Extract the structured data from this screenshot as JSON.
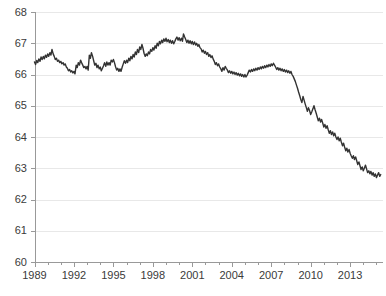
{
  "chart_data": {
    "type": "line",
    "title": "",
    "subtitle": "",
    "xlabel": "",
    "ylabel": "",
    "xlim": [
      1989,
      2015.5
    ],
    "ylim": [
      60,
      68
    ],
    "grid": true,
    "legend": null,
    "line_color": "#333333",
    "axis_color": "#999999",
    "grid_color": "#e8e8e8",
    "y_ticks": [
      60,
      61,
      62,
      63,
      64,
      65,
      66,
      67,
      68
    ],
    "y_tick_labels": [
      "60",
      "61",
      "62",
      "63",
      "64",
      "65",
      "66",
      "67",
      "68"
    ],
    "x_ticks": [
      1989,
      1992,
      1995,
      1998,
      2001,
      2004,
      2007,
      2010,
      2013
    ],
    "x_tick_labels": [
      "1989",
      "1992",
      "1995",
      "1998",
      "2001",
      "2004",
      "2007",
      "2010",
      "2013"
    ],
    "x_minor_tick_step": 1,
    "series": [
      {
        "name": "rate",
        "x": [
          1989.0,
          1989.08,
          1989.17,
          1989.25,
          1989.33,
          1989.42,
          1989.5,
          1989.58,
          1989.67,
          1989.75,
          1989.83,
          1989.92,
          1990.0,
          1990.08,
          1990.17,
          1990.25,
          1990.33,
          1990.42,
          1990.5,
          1990.58,
          1990.67,
          1990.75,
          1990.83,
          1990.92,
          1991.0,
          1991.08,
          1991.17,
          1991.25,
          1991.33,
          1991.42,
          1991.5,
          1991.58,
          1991.67,
          1991.75,
          1991.83,
          1991.92,
          1992.0,
          1992.08,
          1992.17,
          1992.25,
          1992.33,
          1992.42,
          1992.5,
          1992.58,
          1992.67,
          1992.75,
          1992.83,
          1992.92,
          1993.0,
          1993.08,
          1993.17,
          1993.25,
          1993.33,
          1993.42,
          1993.5,
          1993.58,
          1993.67,
          1993.75,
          1993.83,
          1993.92,
          1994.0,
          1994.08,
          1994.17,
          1994.25,
          1994.33,
          1994.42,
          1994.5,
          1994.58,
          1994.67,
          1994.75,
          1994.83,
          1994.92,
          1995.0,
          1995.08,
          1995.17,
          1995.25,
          1995.33,
          1995.42,
          1995.5,
          1995.58,
          1995.67,
          1995.75,
          1995.83,
          1995.92,
          1996.0,
          1996.08,
          1996.17,
          1996.25,
          1996.33,
          1996.42,
          1996.5,
          1996.58,
          1996.67,
          1996.75,
          1996.83,
          1996.92,
          1997.0,
          1997.08,
          1997.17,
          1997.25,
          1997.33,
          1997.42,
          1997.5,
          1997.58,
          1997.67,
          1997.75,
          1997.83,
          1997.92,
          1998.0,
          1998.08,
          1998.17,
          1998.25,
          1998.33,
          1998.42,
          1998.5,
          1998.58,
          1998.67,
          1998.75,
          1998.83,
          1998.92,
          1999.0,
          1999.08,
          1999.17,
          1999.25,
          1999.33,
          1999.42,
          1999.5,
          1999.58,
          1999.67,
          1999.75,
          1999.83,
          1999.92,
          2000.0,
          2000.08,
          2000.17,
          2000.25,
          2000.33,
          2000.42,
          2000.5,
          2000.58,
          2000.67,
          2000.75,
          2000.83,
          2000.92,
          2001.0,
          2001.08,
          2001.17,
          2001.25,
          2001.33,
          2001.42,
          2001.5,
          2001.58,
          2001.67,
          2001.75,
          2001.83,
          2001.92,
          2002.0,
          2002.08,
          2002.17,
          2002.25,
          2002.33,
          2002.42,
          2002.5,
          2002.58,
          2002.67,
          2002.75,
          2002.83,
          2002.92,
          2003.0,
          2003.08,
          2003.17,
          2003.25,
          2003.33,
          2003.42,
          2003.5,
          2003.58,
          2003.67,
          2003.75,
          2003.83,
          2003.92,
          2004.0,
          2004.08,
          2004.17,
          2004.25,
          2004.33,
          2004.42,
          2004.5,
          2004.58,
          2004.67,
          2004.75,
          2004.83,
          2004.92,
          2005.0,
          2005.08,
          2005.17,
          2005.25,
          2005.33,
          2005.42,
          2005.5,
          2005.58,
          2005.67,
          2005.75,
          2005.83,
          2005.92,
          2006.0,
          2006.08,
          2006.17,
          2006.25,
          2006.33,
          2006.42,
          2006.5,
          2006.58,
          2006.67,
          2006.75,
          2006.83,
          2006.92,
          2007.0,
          2007.08,
          2007.17,
          2007.25,
          2007.33,
          2007.42,
          2007.5,
          2007.58,
          2007.67,
          2007.75,
          2007.83,
          2007.92,
          2008.0,
          2008.08,
          2008.17,
          2008.25,
          2008.33,
          2008.42,
          2008.5,
          2008.58,
          2008.67,
          2008.75,
          2008.83,
          2008.92,
          2009.0,
          2009.08,
          2009.17,
          2009.25,
          2009.33,
          2009.42,
          2009.5,
          2009.58,
          2009.67,
          2009.75,
          2009.83,
          2009.92,
          2010.0,
          2010.08,
          2010.17,
          2010.25,
          2010.33,
          2010.42,
          2010.5,
          2010.58,
          2010.67,
          2010.75,
          2010.83,
          2010.92,
          2011.0,
          2011.08,
          2011.17,
          2011.25,
          2011.33,
          2011.42,
          2011.5,
          2011.58,
          2011.67,
          2011.75,
          2011.83,
          2011.92,
          2012.0,
          2012.08,
          2012.17,
          2012.25,
          2012.33,
          2012.42,
          2012.5,
          2012.58,
          2012.67,
          2012.75,
          2012.83,
          2012.92,
          2013.0,
          2013.08,
          2013.17,
          2013.25,
          2013.33,
          2013.42,
          2013.5,
          2013.58,
          2013.67,
          2013.75,
          2013.83,
          2013.92,
          2014.0,
          2014.08,
          2014.17,
          2014.25,
          2014.33,
          2014.42,
          2014.5,
          2014.58,
          2014.67,
          2014.75,
          2014.83,
          2014.92,
          2015.0,
          2015.08,
          2015.17,
          2015.25,
          2015.33
        ],
        "values": [
          66.4,
          66.32,
          66.45,
          66.38,
          66.5,
          66.42,
          66.56,
          66.48,
          66.58,
          66.5,
          66.62,
          66.55,
          66.66,
          66.58,
          66.7,
          66.62,
          66.8,
          66.66,
          66.58,
          66.48,
          66.52,
          66.42,
          66.46,
          66.38,
          66.42,
          66.34,
          66.38,
          66.3,
          66.34,
          66.24,
          66.2,
          66.12,
          66.16,
          66.08,
          66.12,
          66.05,
          66.1,
          66.02,
          66.3,
          66.22,
          66.38,
          66.3,
          66.46,
          66.38,
          66.3,
          66.22,
          66.26,
          66.18,
          66.26,
          66.14,
          66.62,
          66.52,
          66.7,
          66.58,
          66.44,
          66.3,
          66.36,
          66.22,
          66.3,
          66.18,
          66.24,
          66.12,
          66.2,
          66.28,
          66.38,
          66.26,
          66.4,
          66.3,
          66.38,
          66.3,
          66.46,
          66.4,
          66.48,
          66.38,
          66.24,
          66.14,
          66.2,
          66.1,
          66.18,
          66.1,
          66.24,
          66.34,
          66.44,
          66.36,
          66.46,
          66.38,
          66.52,
          66.44,
          66.58,
          66.5,
          66.64,
          66.56,
          66.72,
          66.64,
          66.8,
          66.7,
          66.88,
          66.8,
          66.96,
          66.84,
          66.68,
          66.58,
          66.66,
          66.6,
          66.72,
          66.66,
          66.8,
          66.74,
          66.86,
          66.78,
          66.92,
          66.84,
          67.0,
          66.92,
          67.06,
          66.98,
          67.1,
          67.02,
          67.14,
          67.06,
          67.16,
          67.05,
          67.12,
          67.02,
          67.1,
          67.0,
          67.08,
          66.98,
          67.06,
          67.14,
          67.2,
          67.1,
          67.18,
          67.08,
          67.16,
          67.06,
          67.3,
          67.2,
          67.12,
          67.02,
          67.1,
          67.0,
          67.08,
          66.98,
          67.06,
          66.96,
          67.04,
          66.94,
          67.0,
          66.9,
          66.96,
          66.86,
          66.82,
          66.72,
          66.78,
          66.68,
          66.74,
          66.64,
          66.7,
          66.58,
          66.64,
          66.54,
          66.6,
          66.5,
          66.42,
          66.32,
          66.38,
          66.28,
          66.34,
          66.24,
          66.18,
          66.1,
          66.22,
          66.14,
          66.26,
          66.2,
          66.14,
          66.06,
          66.12,
          66.04,
          66.1,
          66.02,
          66.08,
          66.0,
          66.06,
          65.98,
          66.04,
          65.96,
          66.02,
          65.94,
          66.0,
          65.92,
          66.0,
          65.92,
          65.98,
          66.06,
          66.14,
          66.08,
          66.16,
          66.1,
          66.18,
          66.12,
          66.2,
          66.14,
          66.22,
          66.16,
          66.24,
          66.18,
          66.26,
          66.2,
          66.28,
          66.22,
          66.3,
          66.24,
          66.32,
          66.26,
          66.34,
          66.28,
          66.36,
          66.3,
          66.24,
          66.16,
          66.22,
          66.14,
          66.2,
          66.12,
          66.18,
          66.1,
          66.16,
          66.08,
          66.14,
          66.06,
          66.12,
          66.04,
          66.1,
          66.0,
          65.94,
          65.86,
          65.78,
          65.66,
          65.56,
          65.44,
          65.32,
          65.2,
          65.1,
          65.3,
          65.18,
          65.06,
          64.94,
          64.82,
          64.94,
          64.84,
          64.72,
          64.8,
          64.9,
          65.0,
          64.88,
          64.76,
          64.64,
          64.52,
          64.6,
          64.48,
          64.56,
          64.44,
          64.32,
          64.4,
          64.28,
          64.36,
          64.24,
          64.12,
          64.2,
          64.08,
          64.16,
          64.04,
          64.12,
          64.0,
          63.92,
          64.0,
          63.88,
          63.96,
          63.84,
          63.72,
          63.8,
          63.68,
          63.56,
          63.64,
          63.52,
          63.6,
          63.48,
          63.4,
          63.32,
          63.4,
          63.28,
          63.36,
          63.24,
          63.12,
          63.2,
          63.08,
          62.96,
          63.04,
          62.92,
          63.0,
          63.1,
          62.98,
          62.86,
          62.92,
          62.82,
          62.9,
          62.78,
          62.86,
          62.74,
          62.82,
          62.7,
          62.78,
          62.86,
          62.74,
          62.8
        ]
      }
    ]
  }
}
